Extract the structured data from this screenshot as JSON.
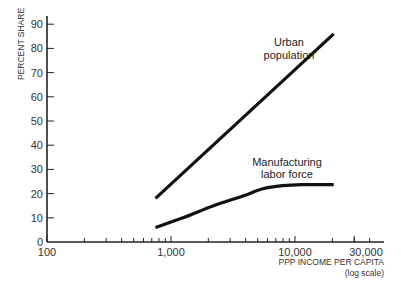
{
  "chart_data": {
    "type": "line",
    "title": "",
    "xlabel": "PPP INCOME PER CAPITA",
    "xlabel_note": "(log scale)",
    "ylabel": "PERCENT SHARE",
    "x_scale": "log",
    "xlim": [
      100,
      40000
    ],
    "ylim": [
      0,
      95
    ],
    "x_ticks": [
      {
        "value": 100,
        "label": "100"
      },
      {
        "value": 1000,
        "label": "1,000"
      },
      {
        "value": 10000,
        "label": "10,000"
      },
      {
        "value": 30000,
        "label": "30,000"
      }
    ],
    "x_minor_ticks": [
      200,
      300,
      400,
      500,
      600,
      700,
      800,
      900,
      2000,
      3000,
      4000,
      5000,
      6000,
      7000,
      8000,
      9000,
      20000,
      30000,
      40000
    ],
    "y_ticks": [
      0,
      10,
      20,
      30,
      40,
      50,
      60,
      70,
      80,
      90
    ],
    "grid": false,
    "legend": "inline labels",
    "series": [
      {
        "name": "Urban population",
        "label_lines": [
          "Urban",
          "population"
        ],
        "x": [
          750,
          20500
        ],
        "values": [
          18,
          86
        ]
      },
      {
        "name": "Manufacturing labor force",
        "label_lines": [
          "Manufacturing",
          "labor force"
        ],
        "x": [
          750,
          1250,
          2200,
          3800,
          5500,
          8000,
          11500,
          20500
        ],
        "values": [
          6,
          10,
          15,
          19,
          22,
          23.3,
          23.7,
          23.7
        ]
      }
    ]
  },
  "colors": {
    "axis": "#222222",
    "line": "#111111",
    "text": "#333333"
  }
}
